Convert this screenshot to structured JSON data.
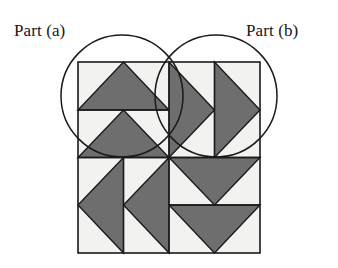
{
  "figure": {
    "background_color": "#ffffff",
    "stroke_color": "#1a1a1a",
    "triangle_fill": "#6e6e6e",
    "tile_background": "#f2f2f0",
    "labels": {
      "left": "Part (a)",
      "right": "Part (b)"
    },
    "square": {
      "name": "main-square",
      "x": 78,
      "y": 62,
      "width": 182,
      "height": 191,
      "mid_x": 169,
      "mid_y": 157.5
    },
    "circles": [
      {
        "name": "circle-part-a",
        "label": "Part (a)",
        "cx": 122,
        "cy": 96,
        "r": 61
      },
      {
        "name": "circle-part-b",
        "label": "Part (b)",
        "cx": 216,
        "cy": 96,
        "r": 61
      }
    ],
    "quadrants": [
      {
        "name": "quadrant-top-left",
        "direction": "up",
        "triangle_count": 2,
        "arrangement": "stacked-vertical"
      },
      {
        "name": "quadrant-top-right",
        "direction": "right",
        "triangle_count": 2,
        "arrangement": "side-by-side-horizontal"
      },
      {
        "name": "quadrant-bottom-left",
        "direction": "left",
        "triangle_count": 2,
        "arrangement": "side-by-side-horizontal"
      },
      {
        "name": "quadrant-bottom-right",
        "direction": "down",
        "triangle_count": 2,
        "arrangement": "stacked-vertical"
      }
    ],
    "triangles": [
      {
        "name": "triangle-tl-upper",
        "points": "78,110 169,110 123.5,62"
      },
      {
        "name": "triangle-tl-lower",
        "points": "78,157.5 169,157.5 123.5,110"
      },
      {
        "name": "triangle-tr-left",
        "points": "169,62 169,157.5 214.5,110"
      },
      {
        "name": "triangle-tr-right",
        "points": "214.5,62 214.5,157.5 260,110"
      },
      {
        "name": "triangle-bl-left",
        "points": "123.5,157.5 123.5,253 78,205"
      },
      {
        "name": "triangle-bl-right",
        "points": "169,157.5 169,253 123.5,205"
      },
      {
        "name": "triangle-br-upper",
        "points": "169,157.5 260,157.5 214.5,205"
      },
      {
        "name": "triangle-br-lower",
        "points": "169,205 260,205 214.5,253"
      }
    ],
    "grid_lines": [
      {
        "name": "gridline-vertical-center",
        "x1": 169,
        "y1": 62,
        "x2": 169,
        "y2": 253
      },
      {
        "name": "gridline-horizontal-center",
        "x1": 78,
        "y1": 157.5,
        "x2": 260,
        "y2": 157.5
      },
      {
        "name": "gridline-tl-horizontal",
        "x1": 78,
        "y1": 110,
        "x2": 169,
        "y2": 110
      },
      {
        "name": "gridline-tr-vertical",
        "x1": 214.5,
        "y1": 62,
        "x2": 214.5,
        "y2": 157.5
      },
      {
        "name": "gridline-bl-vertical",
        "x1": 123.5,
        "y1": 157.5,
        "x2": 123.5,
        "y2": 253
      },
      {
        "name": "gridline-br-horizontal",
        "x1": 169,
        "y1": 205,
        "x2": 260,
        "y2": 205
      }
    ],
    "label_positions": {
      "left": {
        "x": 14,
        "y": 36
      },
      "right": {
        "x": 246,
        "y": 36
      }
    }
  }
}
